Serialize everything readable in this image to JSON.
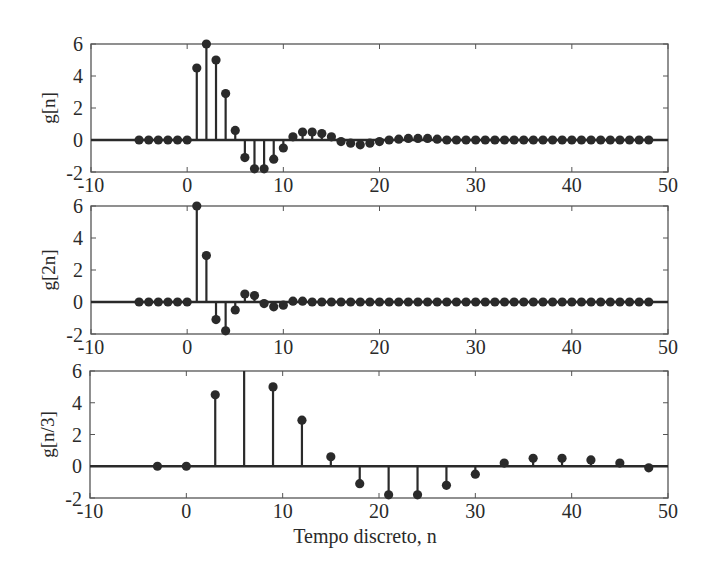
{
  "figure": {
    "xlabel": "Tempo discreto, n",
    "colors": {
      "ink": "#2a2a2a",
      "frame": "#555555",
      "background": "#ffffff"
    }
  },
  "chart_data": [
    {
      "type": "stem",
      "title": "",
      "ylabel": "g[n]",
      "xlabel": "",
      "xlim": [
        -10,
        50
      ],
      "ylim": [
        -2,
        6
      ],
      "xticks": [
        -10,
        0,
        10,
        20,
        30,
        40,
        50
      ],
      "yticks": [
        -2,
        0,
        2,
        4,
        6
      ],
      "grid": false,
      "x": [
        -5,
        -4,
        -3,
        -2,
        -1,
        0,
        1,
        2,
        3,
        4,
        5,
        6,
        7,
        8,
        9,
        10,
        11,
        12,
        13,
        14,
        15,
        16,
        17,
        18,
        19,
        20,
        21,
        22,
        23,
        24,
        25,
        26,
        27,
        28,
        29,
        30,
        31,
        32,
        33,
        34,
        35,
        36,
        37,
        38,
        39,
        40,
        41,
        42,
        43,
        44,
        45,
        46,
        47,
        48
      ],
      "values": [
        0,
        0,
        0,
        0,
        0,
        0,
        4.5,
        6,
        5,
        2.9,
        0.6,
        -1.1,
        -1.8,
        -1.8,
        -1.2,
        -0.5,
        0.2,
        0.5,
        0.5,
        0.4,
        0.2,
        -0.1,
        -0.2,
        -0.3,
        -0.2,
        -0.1,
        0,
        0.05,
        0.1,
        0.1,
        0.1,
        0.05,
        0,
        0,
        0,
        0,
        0,
        0,
        0,
        0,
        0,
        0,
        0,
        0,
        0,
        0,
        0,
        0,
        0,
        0,
        0,
        0,
        0,
        0
      ]
    },
    {
      "type": "stem",
      "title": "",
      "ylabel": "g[2n]",
      "xlabel": "",
      "xlim": [
        -10,
        50
      ],
      "ylim": [
        -2,
        6
      ],
      "xticks": [
        -10,
        0,
        10,
        20,
        30,
        40,
        50
      ],
      "yticks": [
        -2,
        0,
        2,
        4,
        6
      ],
      "grid": false,
      "x": [
        -5,
        -4,
        -3,
        -2,
        -1,
        0,
        1,
        2,
        3,
        4,
        5,
        6,
        7,
        8,
        9,
        10,
        11,
        12,
        13,
        14,
        15,
        16,
        17,
        18,
        19,
        20,
        21,
        22,
        23,
        24,
        25,
        26,
        27,
        28,
        29,
        30,
        31,
        32,
        33,
        34,
        35,
        36,
        37,
        38,
        39,
        40,
        41,
        42,
        43,
        44,
        45,
        46,
        47,
        48
      ],
      "values": [
        0,
        0,
        0,
        0,
        0,
        0,
        6,
        2.9,
        -1.1,
        -1.8,
        -0.5,
        0.5,
        0.4,
        -0.1,
        -0.3,
        -0.2,
        0.05,
        0.05,
        0,
        0,
        0,
        0,
        0,
        0,
        0,
        0,
        0,
        0,
        0,
        0,
        0,
        0,
        0,
        0,
        0,
        0,
        0,
        0,
        0,
        0,
        0,
        0,
        0,
        0,
        0,
        0,
        0,
        0,
        0,
        0,
        0,
        0,
        0,
        0
      ]
    },
    {
      "type": "stem",
      "title": "",
      "ylabel": "g[n/3]",
      "xlabel": "Tempo discreto, n",
      "xlim": [
        -10,
        50
      ],
      "ylim": [
        -2,
        6
      ],
      "xticks": [
        -10,
        0,
        10,
        20,
        30,
        40,
        50
      ],
      "yticks": [
        -2,
        0,
        2,
        4,
        6
      ],
      "grid": false,
      "x": [
        -3,
        0,
        3,
        6,
        9,
        12,
        15,
        18,
        21,
        24,
        27,
        30,
        33,
        36,
        39,
        42,
        45,
        48
      ],
      "values": [
        0,
        0,
        4.5,
        6,
        5,
        2.9,
        0.6,
        -1.1,
        -1.8,
        -1.8,
        -1.2,
        -0.5,
        0.2,
        0.5,
        0.5,
        0.4,
        0.2,
        -0.1
      ],
      "hidden_markers_x": [
        6
      ]
    }
  ]
}
